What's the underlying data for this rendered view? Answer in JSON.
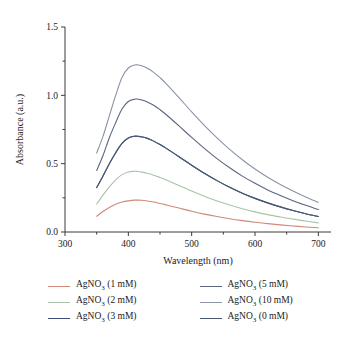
{
  "chart_data": {
    "type": "line",
    "title": "",
    "xlabel": "Wavelength (nm)",
    "ylabel": "Absorbance (a.u.)",
    "xlim": [
      300,
      720
    ],
    "ylim": [
      0.0,
      1.5
    ],
    "xticks": [
      300,
      400,
      500,
      600,
      700
    ],
    "xtick_labels": [
      "300",
      "400",
      "500",
      "600",
      "700"
    ],
    "yticks": [
      0.0,
      0.5,
      1.0,
      1.5
    ],
    "ytick_labels": [
      "0.0",
      "0.5",
      "1.0",
      "1.5"
    ],
    "grid": false,
    "legend_position": "below",
    "x": [
      350,
      360,
      370,
      380,
      390,
      400,
      410,
      415,
      420,
      430,
      440,
      450,
      460,
      480,
      500,
      520,
      540,
      560,
      580,
      600,
      620,
      640,
      660,
      680,
      700
    ],
    "series": [
      {
        "name": "AgNO3 (1 mM)",
        "label": "AgNO₃ (1 mM)",
        "color": "#d08878",
        "values": [
          0.115,
          0.15,
          0.18,
          0.203,
          0.219,
          0.228,
          0.233,
          0.233,
          0.232,
          0.227,
          0.219,
          0.209,
          0.198,
          0.175,
          0.152,
          0.131,
          0.113,
          0.097,
          0.083,
          0.071,
          0.061,
          0.052,
          0.044,
          0.037,
          0.031
        ]
      },
      {
        "name": "AgNO3 (2 mM)",
        "label": "AgNO₃ (2 mM)",
        "color": "#a8c4a8",
        "values": [
          0.205,
          0.27,
          0.33,
          0.382,
          0.42,
          0.439,
          0.444,
          0.443,
          0.44,
          0.43,
          0.416,
          0.399,
          0.381,
          0.341,
          0.3,
          0.262,
          0.227,
          0.197,
          0.17,
          0.147,
          0.127,
          0.11,
          0.094,
          0.08,
          0.067
        ]
      },
      {
        "name": "AgNO3 (3 mM)",
        "label": "AgNO₃ (3 mM)",
        "color": "#3a4a7a",
        "values": [
          0.325,
          0.41,
          0.5,
          0.58,
          0.648,
          0.688,
          0.701,
          0.7,
          0.697,
          0.685,
          0.665,
          0.64,
          0.612,
          0.551,
          0.489,
          0.43,
          0.376,
          0.327,
          0.284,
          0.246,
          0.213,
          0.184,
          0.158,
          0.134,
          0.113
        ]
      },
      {
        "name": "AgNO3 (5 mM)",
        "label": "AgNO₃ (5 mM)",
        "color": "#5a6580",
        "values": [
          0.45,
          0.56,
          0.69,
          0.8,
          0.9,
          0.955,
          0.972,
          0.972,
          0.968,
          0.952,
          0.927,
          0.895,
          0.858,
          0.776,
          0.692,
          0.612,
          0.537,
          0.47,
          0.409,
          0.356,
          0.308,
          0.267,
          0.229,
          0.195,
          0.164
        ]
      },
      {
        "name": "AgNO3 (10 mM)",
        "label": "AgNO₃ (10 mM)",
        "color": "#8a94a5",
        "values": [
          0.578,
          0.7,
          0.85,
          1.0,
          1.13,
          1.2,
          1.222,
          1.222,
          1.218,
          1.198,
          1.168,
          1.129,
          1.084,
          0.983,
          0.879,
          0.78,
          0.688,
          0.604,
          0.529,
          0.461,
          0.401,
          0.348,
          0.3,
          0.257,
          0.218
        ]
      },
      {
        "name": "AgNO3 (0 mM)",
        "label": "AgNO₃ (0 mM)",
        "color": "#4a5a72",
        "values": [
          0.325,
          0.41,
          0.5,
          0.58,
          0.648,
          0.688,
          0.701,
          0.7,
          0.697,
          0.685,
          0.665,
          0.64,
          0.612,
          0.551,
          0.489,
          0.43,
          0.376,
          0.327,
          0.284,
          0.246,
          0.213,
          0.184,
          0.158,
          0.134,
          0.113
        ]
      }
    ],
    "legend_order": [
      "AgNO3 (1 mM)",
      "AgNO3 (5 mM)",
      "AgNO3 (2 mM)",
      "AgNO3 (10 mM)",
      "AgNO3 (3 mM)",
      "AgNO3 (0 mM)"
    ]
  }
}
